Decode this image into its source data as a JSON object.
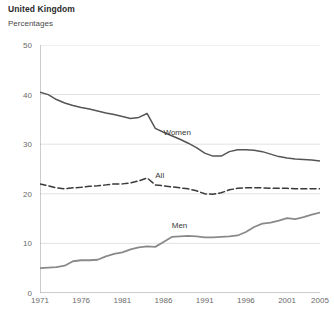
{
  "header": {
    "title": "United Kingdom",
    "subtitle": "Percentages"
  },
  "chart_data": {
    "type": "line",
    "title": "United Kingdom",
    "subtitle": "Percentages",
    "xlabel": "",
    "ylabel": "Percentages",
    "xlim": [
      1971,
      2005
    ],
    "ylim": [
      0,
      50
    ],
    "yticks": [
      0,
      10,
      20,
      30,
      40,
      50
    ],
    "xticks": [
      1971,
      1976,
      1981,
      1986,
      1991,
      1996,
      2001,
      2005
    ],
    "grid": "horizontal",
    "legend": "inline-labels",
    "x": [
      1971,
      1972,
      1973,
      1974,
      1975,
      1976,
      1977,
      1978,
      1979,
      1980,
      1981,
      1982,
      1983,
      1984,
      1985,
      1986,
      1987,
      1988,
      1989,
      1990,
      1991,
      1992,
      1993,
      1994,
      1995,
      1996,
      1997,
      1998,
      1999,
      2000,
      2001,
      2002,
      2003,
      2004,
      2005
    ],
    "series": [
      {
        "name": "Women",
        "color": "#555555",
        "style": "solid",
        "label_x": 1986,
        "label_y": 33.2,
        "values": [
          40.5,
          40.0,
          39.0,
          38.3,
          37.8,
          37.4,
          37.1,
          36.7,
          36.3,
          36.0,
          35.6,
          35.2,
          35.4,
          36.2,
          33.2,
          32.4,
          31.7,
          31.0,
          30.2,
          29.3,
          28.2,
          27.6,
          27.6,
          28.5,
          28.9,
          28.9,
          28.8,
          28.5,
          28.0,
          27.5,
          27.2,
          27.0,
          26.9,
          26.8,
          26.6
        ]
      },
      {
        "name": "All",
        "color": "#3a3a3a",
        "style": "dashed",
        "label_x": 1985,
        "label_y": 24.5,
        "values": [
          22.0,
          21.6,
          21.2,
          21.0,
          21.2,
          21.3,
          21.5,
          21.6,
          21.8,
          22.0,
          22.0,
          22.2,
          22.6,
          23.2,
          21.8,
          21.6,
          21.4,
          21.2,
          21.0,
          20.6,
          20.0,
          19.9,
          20.2,
          20.8,
          21.1,
          21.2,
          21.2,
          21.2,
          21.1,
          21.1,
          21.1,
          21.0,
          21.0,
          21.0,
          21.0
        ]
      },
      {
        "name": "Men",
        "color": "#8a8a8a",
        "style": "solid",
        "label_x": 1987,
        "label_y": 14.5,
        "values": [
          5.0,
          5.1,
          5.2,
          5.5,
          6.4,
          6.6,
          6.6,
          6.7,
          7.4,
          7.9,
          8.2,
          8.8,
          9.2,
          9.4,
          9.3,
          10.3,
          11.3,
          11.4,
          11.5,
          11.4,
          11.2,
          11.2,
          11.3,
          11.4,
          11.6,
          12.3,
          13.3,
          14.0,
          14.2,
          14.6,
          15.1,
          14.9,
          15.3,
          15.8,
          16.2
        ]
      }
    ]
  }
}
